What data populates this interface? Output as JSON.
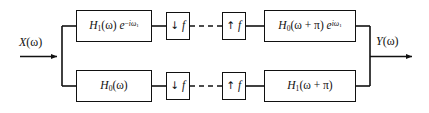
{
  "diagram": {
    "background_color": "#ffffff",
    "line_color": "#111111",
    "ports": {
      "input": {
        "label_plain": "X(w)",
        "var": "X",
        "arg": "(ω)"
      },
      "output": {
        "label_plain": "Y(w)",
        "var": "Y",
        "arg": "(ω)"
      }
    },
    "branches": [
      {
        "name": "top-branch",
        "blocks": [
          {
            "id": "analysis-filter-top",
            "plain": "H1(ω) e^{-iω1}",
            "base": "H",
            "base_sub": "1",
            "arg": "(ω)",
            "exp_base": "e",
            "exp_sup": "−iω₁"
          },
          {
            "id": "downsampler-top",
            "plain": "↓ f",
            "arrow": "↓",
            "factor": "f"
          },
          {
            "id": "upsampler-top",
            "plain": "↑ f",
            "arrow": "↑",
            "factor": "f"
          },
          {
            "id": "synthesis-filter-top",
            "plain": "H0(ω + π) e^{iω1}",
            "base": "H",
            "base_sub": "0",
            "arg": "(ω + π)",
            "exp_base": "e",
            "exp_sup": "iω₁"
          }
        ]
      },
      {
        "name": "bottom-branch",
        "blocks": [
          {
            "id": "analysis-filter-bottom",
            "plain": "H0(ω)",
            "base": "H",
            "base_sub": "0",
            "arg": "(ω)",
            "exp_base": "",
            "exp_sup": ""
          },
          {
            "id": "downsampler-bottom",
            "plain": "↓ f",
            "arrow": "↓",
            "factor": "f"
          },
          {
            "id": "upsampler-bottom",
            "plain": "↑ f",
            "arrow": "↑",
            "factor": "f"
          },
          {
            "id": "synthesis-filter-bottom",
            "plain": "H1(ω + π)",
            "base": "H",
            "base_sub": "1",
            "arg": "(ω + π)",
            "exp_base": "",
            "exp_sup": ""
          }
        ]
      }
    ],
    "connectors": {
      "dashed_link_note": "dashed segment between downsampler and upsampler"
    }
  }
}
